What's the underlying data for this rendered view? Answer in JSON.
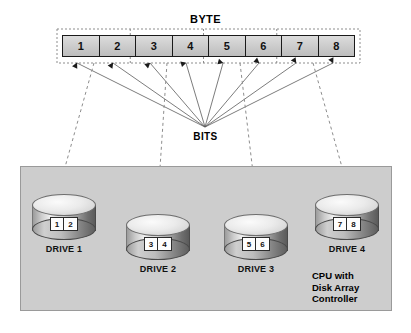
{
  "diagram": {
    "byte_title": "BYTE",
    "bits_label": "BITS",
    "byte_cells": [
      {
        "label": "1"
      },
      {
        "label": "2"
      },
      {
        "label": "3"
      },
      {
        "label": "4"
      },
      {
        "label": "5"
      },
      {
        "label": "6"
      },
      {
        "label": "7"
      },
      {
        "label": "8"
      }
    ],
    "drives": [
      {
        "label": "DRIVE 1",
        "bits": [
          "1",
          "2"
        ]
      },
      {
        "label": "DRIVE 2",
        "bits": [
          "3",
          "4"
        ]
      },
      {
        "label": "DRIVE 3",
        "bits": [
          "5",
          "6"
        ]
      },
      {
        "label": "DRIVE 4",
        "bits": [
          "7",
          "8"
        ]
      }
    ],
    "cpu_caption": {
      "line1": "CPU with",
      "line2": "Disk Array",
      "line3": "Controller"
    },
    "colors": {
      "panel_fill": "#cdcdcd",
      "byte_cell_fill": "#cbcbcb",
      "line": "#555555",
      "text": "#000000"
    }
  }
}
